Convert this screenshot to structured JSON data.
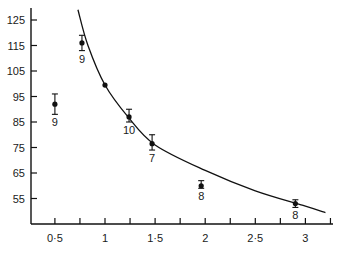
{
  "chart_data": {
    "type": "scatter",
    "title": "",
    "xlabel": "",
    "ylabel": "",
    "xlim": [
      0.26,
      3.28
    ],
    "ylim": [
      46,
      129
    ],
    "grid": false,
    "legend": null,
    "x_ticks": [
      0.5,
      1,
      1.5,
      2,
      2.5,
      3
    ],
    "x_tick_labels": [
      "0·5",
      "1",
      "1·5",
      "2",
      "2·5",
      "3"
    ],
    "x_minor_ticks": [
      0.75,
      1.25,
      1.75,
      2.25,
      2.75,
      3.25
    ],
    "y_ticks": [
      55,
      65,
      75,
      85,
      95,
      105,
      115,
      125
    ],
    "y_tick_labels": [
      "55",
      "65",
      "75",
      "85",
      "95",
      "105",
      "115",
      "125"
    ],
    "series": [
      {
        "name": "observations",
        "style": "points-with-error-bars",
        "points": [
          {
            "x": 0.5,
            "y": 92,
            "err_low": 88,
            "err_high": 96,
            "label": "9"
          },
          {
            "x": 0.77,
            "y": 116,
            "err_low": 113,
            "err_high": 119,
            "label": "9"
          },
          {
            "x": 1.0,
            "y": 99.5,
            "err_low": null,
            "err_high": null,
            "label": ""
          },
          {
            "x": 1.24,
            "y": 87,
            "err_low": 85,
            "err_high": 90,
            "label": "10"
          },
          {
            "x": 1.47,
            "y": 76.5,
            "err_low": 74,
            "err_high": 80,
            "label": "7"
          },
          {
            "x": 1.96,
            "y": 60,
            "err_low": 59,
            "err_high": 62,
            "label": "8"
          },
          {
            "x": 2.9,
            "y": 53,
            "err_low": 51.5,
            "err_high": 54.5,
            "label": "8"
          }
        ]
      },
      {
        "name": "fitted curve",
        "style": "line",
        "points": [
          {
            "x": 0.73,
            "y": 129
          },
          {
            "x": 0.83,
            "y": 115
          },
          {
            "x": 1.0,
            "y": 99.5
          },
          {
            "x": 1.23,
            "y": 87
          },
          {
            "x": 1.5,
            "y": 76
          },
          {
            "x": 2.0,
            "y": 66
          },
          {
            "x": 2.5,
            "y": 58
          },
          {
            "x": 3.0,
            "y": 52
          },
          {
            "x": 3.2,
            "y": 49.5
          }
        ]
      }
    ]
  }
}
